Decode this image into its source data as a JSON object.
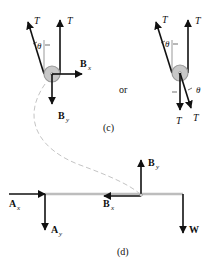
{
  "figure_c": {
    "caption": "(c)",
    "connector": "or",
    "left_pulley": {
      "forces": {
        "T_angled": "T",
        "T_vertical": "T",
        "Bx": "B",
        "Bx_sub": "x",
        "By": "B",
        "By_sub": "y"
      },
      "angle_label": "θ"
    },
    "right_pulley": {
      "forces": {
        "T_angled_top": "T",
        "T_vertical_top": "T",
        "T_down": "T",
        "T_angled_bottom": "T"
      },
      "angle_top": "θ",
      "angle_bottom": "θ"
    }
  },
  "figure_d": {
    "caption": "(d)",
    "forces": {
      "Ax": "A",
      "Ax_sub": "x",
      "Ay": "A",
      "Ay_sub": "y",
      "Bx": "B",
      "Bx_sub": "x",
      "By": "B",
      "By_sub": "y",
      "W": "W"
    }
  },
  "colors": {
    "ink": "#111111",
    "beam": "#bdbdbd",
    "pulley_fill": "#c8c8c8",
    "pulley_ring": "#9a9a9a",
    "dashed_curve": "#c4c4c4"
  }
}
